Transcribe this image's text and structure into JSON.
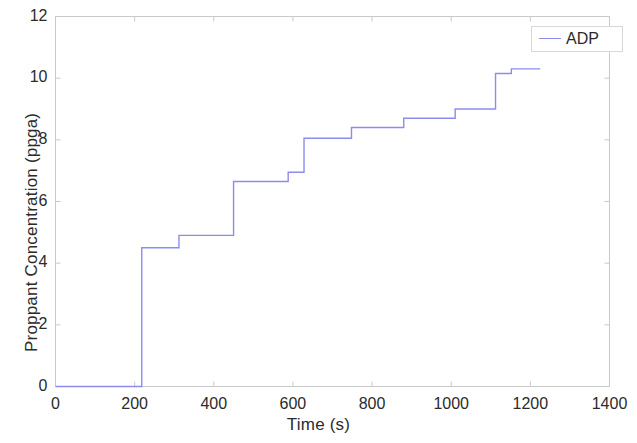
{
  "chart_data": {
    "type": "line",
    "title": "",
    "subtitle": "",
    "xlabel": "Time (s)",
    "ylabel": "Proppant Concentration (ppga)",
    "xlim": [
      0,
      1400
    ],
    "ylim": [
      0,
      12
    ],
    "xticks": [
      0,
      200,
      400,
      600,
      800,
      1000,
      1200,
      1400
    ],
    "yticks": [
      0,
      2,
      4,
      6,
      8,
      10,
      12
    ],
    "grid": false,
    "legend_position": "top-right",
    "line_style": "staircase",
    "series": [
      {
        "name": "ADP",
        "color": "#8c8cf0",
        "x": [
          0,
          218,
          218,
          312,
          312,
          352,
          352,
          450,
          450,
          488,
          488,
          588,
          588,
          628,
          628,
          708,
          708,
          748,
          748,
          840,
          840,
          880,
          880,
          970,
          970,
          1010,
          1010,
          1112,
          1112,
          1152,
          1152,
          1225
        ],
        "y": [
          0,
          0,
          4.5,
          4.5,
          4.9,
          4.9,
          4.9,
          4.9,
          6.65,
          6.65,
          6.65,
          6.65,
          6.95,
          6.95,
          8.05,
          8.05,
          8.05,
          8.05,
          8.4,
          8.4,
          8.4,
          8.4,
          8.7,
          8.7,
          8.7,
          8.7,
          9.0,
          9.0,
          10.15,
          10.15,
          10.3,
          10.3
        ],
        "steps": [
          {
            "start_time": 0,
            "end_time": 218,
            "value": 0
          },
          {
            "start_time": 218,
            "end_time": 312,
            "value": 4.5
          },
          {
            "start_time": 312,
            "end_time": 450,
            "value": 4.9
          },
          {
            "start_time": 450,
            "end_time": 588,
            "value": 6.65
          },
          {
            "start_time": 588,
            "end_time": 628,
            "value": 6.95
          },
          {
            "start_time": 628,
            "end_time": 748,
            "value": 8.05
          },
          {
            "start_time": 748,
            "end_time": 880,
            "value": 8.4
          },
          {
            "start_time": 880,
            "end_time": 1010,
            "value": 8.7
          },
          {
            "start_time": 1010,
            "end_time": 1112,
            "value": 9.0
          },
          {
            "start_time": 1112,
            "end_time": 1152,
            "value": 10.15
          },
          {
            "start_time": 1152,
            "end_time": 1225,
            "value": 10.3
          }
        ]
      }
    ]
  },
  "legend": {
    "entries": [
      {
        "label": "ADP",
        "color": "#8c8cf0"
      }
    ]
  },
  "axes": {
    "x_tick_labels": [
      "0",
      "200",
      "400",
      "600",
      "800",
      "1000",
      "1200",
      "1400"
    ],
    "y_tick_labels": [
      "0",
      "2",
      "4",
      "6",
      "8",
      "10",
      "12"
    ],
    "x_title": "Time (s)",
    "y_title": "Proppant Concentration (ppga)"
  },
  "style": {
    "axis_color": "#c9c9c9",
    "text_color": "#2b2b2b",
    "background": "#ffffff"
  }
}
